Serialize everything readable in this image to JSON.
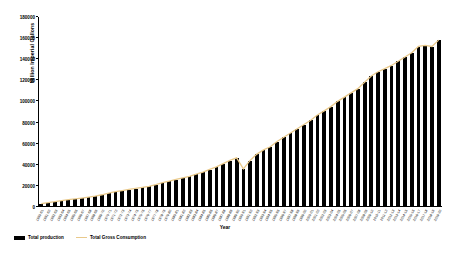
{
  "chart": {
    "type": "bar",
    "ylabel": "Million Imperial Gallons",
    "xlabel": "Year"
  },
  "legend": {
    "items": [
      {
        "label": "Total production",
        "marker": "bar-swatch-icon",
        "color": "#000000"
      },
      {
        "label": "Total Gross Consumption",
        "marker": "line-swatch-icon",
        "color": "#E9C98B"
      }
    ]
  },
  "yaxis": {
    "ticks": [
      "0",
      "20000",
      "40000",
      "60000",
      "80000",
      "100000",
      "120000",
      "140000",
      "160000",
      "180000"
    ]
  },
  "chart_data": {
    "type": "bar",
    "title": "",
    "subtitle": "",
    "xlabel": "Year",
    "ylabel": "Million Imperial Gallons",
    "ylim": [
      0,
      180000
    ],
    "yticks": [
      0,
      20000,
      40000,
      60000,
      80000,
      100000,
      120000,
      140000,
      160000,
      180000
    ],
    "grid": false,
    "legend_position": "bottom-left",
    "categories": [
      "1960-61",
      "1961-62",
      "1962-63",
      "1963-64",
      "1964-65",
      "1965-66",
      "1966-67",
      "1967-68",
      "1968-69",
      "1969-70",
      "1970-71",
      "1971-72",
      "1972-73",
      "1973-74",
      "1974-75",
      "1975-76",
      "1976-77",
      "1977-78",
      "1978-79",
      "1979-80",
      "1980-81",
      "1981-82",
      "1982-83",
      "1983-84",
      "1984-85",
      "1985-86",
      "1986-87",
      "1987-88",
      "1988-89",
      "1989-90",
      "1990-91",
      "1991-92",
      "1992-93",
      "1993-94",
      "1994-95",
      "1995-96",
      "1996-97",
      "1997-98",
      "1998-99",
      "1999-00",
      "2000-01",
      "2001-02",
      "2002-03",
      "2003-04",
      "2004-05",
      "2005-06",
      "2006-07",
      "2007-08",
      "2008-09",
      "2009-10",
      "2010-11",
      "2011-12",
      "2012-13",
      "2013-14",
      "2014-15",
      "2015-16",
      "2016-17",
      "2017-18",
      "2018-19",
      "2019-20"
    ],
    "series": [
      {
        "name": "Total production",
        "kind": "bar",
        "color": "#000000",
        "values": [
          3200,
          4100,
          5000,
          5900,
          6800,
          7600,
          8400,
          9300,
          10200,
          11500,
          13000,
          14500,
          15500,
          16500,
          17500,
          18500,
          19500,
          21000,
          23000,
          24500,
          26000,
          27500,
          29000,
          31000,
          33000,
          35500,
          38000,
          41000,
          44000,
          46500,
          36000,
          44000,
          50000,
          54000,
          57000,
          62000,
          66000,
          70000,
          74000,
          78000,
          82000,
          87000,
          91000,
          95000,
          100000,
          104000,
          108000,
          112000,
          118000,
          124000,
          128000,
          131000,
          134000,
          138000,
          142000,
          146000,
          152000,
          153000,
          152000,
          158000
        ]
      },
      {
        "name": "Total Gross Consumption",
        "kind": "line",
        "color": "#E9C98B",
        "values": [
          3300,
          4200,
          5100,
          6000,
          6900,
          7700,
          8500,
          9400,
          10300,
          11600,
          13100,
          14600,
          15600,
          16600,
          17600,
          18600,
          19600,
          21100,
          23100,
          24600,
          26100,
          27600,
          29100,
          31100,
          33100,
          35600,
          38100,
          41100,
          44100,
          46600,
          36100,
          44100,
          50100,
          54100,
          57100,
          62100,
          66100,
          70100,
          74100,
          78100,
          82100,
          87100,
          91100,
          95100,
          100100,
          104100,
          108100,
          112100,
          118100,
          124100,
          128100,
          131100,
          134100,
          138100,
          142100,
          146100,
          152100,
          153100,
          152100,
          158100
        ]
      }
    ]
  }
}
